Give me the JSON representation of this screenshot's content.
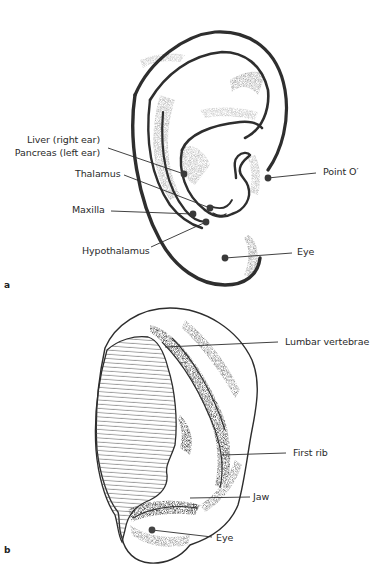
{
  "figure_a": {
    "panel_label": "a",
    "labels": {
      "liver_line1": "Liver (right ear)",
      "liver_line2": "Pancreas (left ear)",
      "thalamus": "Thalamus",
      "maxilla": "Maxilla",
      "hypothalamus": "Hypothalamus",
      "point_o": "Point O′",
      "eye": "Eye"
    }
  },
  "figure_b": {
    "panel_label": "b",
    "labels": {
      "lumbar": "Lumbar vertebrae",
      "first_rib": "First rib",
      "jaw": "Jaw",
      "eye": "Eye"
    }
  },
  "colors": {
    "ink": "#2a2a2a",
    "shade": "#8a8a8a",
    "background": "#ffffff"
  }
}
